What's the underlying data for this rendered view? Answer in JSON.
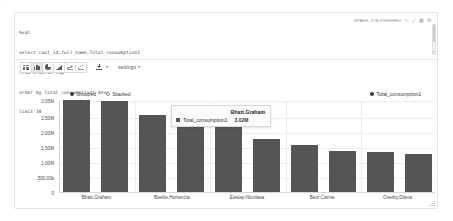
{
  "stray_mark": "·",
  "editor": {
    "lines": [
      "%sql",
      "select cust_id,full_name,Total_consumption1",
      "from orders2_tmp",
      "order by Total_consumption1 desc",
      "limit 10"
    ],
    "scrollbar_arrow": "▾"
  },
  "status": {
    "grid_icon": "grid-icon",
    "label": "SPARK JOB FINISHED",
    "play_icon": "▷",
    "expand_icon": "⤢",
    "layout_icon": "▦",
    "gear_icon": "⚙"
  },
  "toolbar": {
    "buttons": [
      {
        "name": "table-chart",
        "icon": "table-icon",
        "active": false
      },
      {
        "name": "bar-chart",
        "icon": "bar-chart-icon",
        "active": true
      },
      {
        "name": "pie-chart",
        "icon": "pie-chart-icon",
        "active": false
      },
      {
        "name": "area-chart",
        "icon": "area-chart-icon",
        "active": false
      },
      {
        "name": "line-chart",
        "icon": "line-chart-icon",
        "active": false
      },
      {
        "name": "scatter-chart",
        "icon": "scatter-chart-icon",
        "active": false
      }
    ],
    "download_icon": "download-icon",
    "download_caret": "▾",
    "settings_label": "settings",
    "settings_caret": "▾"
  },
  "chart_controls": {
    "modes": [
      {
        "label": "Grouped",
        "selected": true
      },
      {
        "label": "Stacked",
        "selected": false
      }
    ],
    "legend": [
      {
        "label": "Total_consumption1",
        "color": "#3c3c3c"
      }
    ]
  },
  "tooltip": {
    "title": "Bhatt.Graham",
    "series_label": "Total_consumption1",
    "value": "3.02M",
    "swatch_color": "#555555"
  },
  "chart_data": {
    "type": "bar",
    "title": "",
    "xlabel": "",
    "ylabel": "",
    "grid": true,
    "legend_position": "top-right",
    "bar_color": "#555555",
    "series": [
      {
        "name": "Total_consumption1",
        "values": [
          3050000,
          3020000,
          2560000,
          2500000,
          2420000,
          1760000,
          1560000,
          1370000,
          1320000,
          1270000
        ]
      }
    ],
    "categories": [
      "Bhatt.Graham",
      "",
      "Beebe.Hortencia",
      "",
      "Easlep.Nicolasa",
      "",
      "Betz.Carnie",
      "",
      "Overby.Diana",
      ""
    ],
    "x_tick_labels": [
      "Bhatt.Graham",
      "Beebe.Hortencia",
      "Easlep.Nicolasa",
      "Betz.Carnie",
      "Overby.Diana"
    ],
    "y_tick_labels": [
      "3.05M",
      "2.50M",
      "2.00M",
      "1.50M",
      "1.00M",
      "500.00k",
      "0"
    ],
    "y_tick_values": [
      3050000,
      2500000,
      2000000,
      1500000,
      1000000,
      500000,
      0
    ],
    "ylim": [
      0,
      3050000
    ]
  }
}
